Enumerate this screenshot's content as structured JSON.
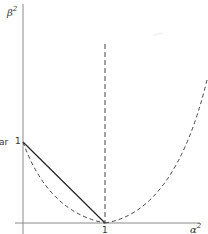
{
  "diagram": {
    "labels": {
      "y_axis": "β",
      "y_axis_exp": "2",
      "x_axis": "α",
      "x_axis_exp": "2",
      "y_tick_one": "1",
      "x_tick_one": "1",
      "left_cut_text": "ar"
    },
    "colors": {
      "axis": "#8a8a8a",
      "solid_line": "#222222",
      "dashed": "#444444",
      "text": "#333333"
    }
  }
}
